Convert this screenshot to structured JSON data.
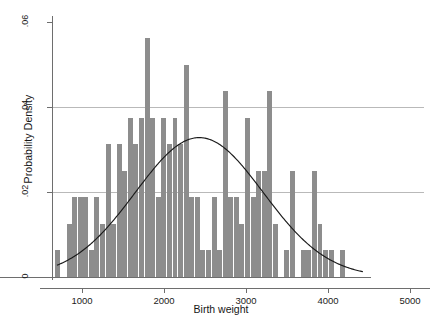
{
  "figure": {
    "xlabel": "Birth weight",
    "ylabel": "Probability Density",
    "caption": ""
  },
  "axes": {
    "y_ticks": [
      "0",
      ".02",
      ".04",
      ".06"
    ],
    "x_ticks": [
      "1000",
      "2000",
      "3000",
      "4000",
      "5000"
    ]
  },
  "colors": {
    "bar_fill": "#8d8d8d",
    "curve": "#1a1a1a",
    "grid": "#b9b9b9",
    "axis": "#6e6e6e",
    "background": "#ffffff"
  },
  "chart_data": {
    "type": "bar",
    "title": "",
    "xlabel": "Birth weight",
    "ylabel": "Probability Density",
    "xlim": [
      500,
      5000
    ],
    "ylim": [
      0,
      0.06
    ],
    "grid": "horizontal gridlines at .02 and .04",
    "legend": "none",
    "bin_width": 68,
    "bar_color": "#8d8d8d",
    "overlay": {
      "type": "line",
      "name": "normal density fit",
      "mean": 2430,
      "sd": 780,
      "peak_value": 0.0328,
      "x_start": 700,
      "x_end": 4420
    },
    "x": [
      710,
      778,
      846,
      914,
      982,
      1050,
      1118,
      1186,
      1254,
      1322,
      1390,
      1458,
      1526,
      1594,
      1662,
      1730,
      1798,
      1866,
      1934,
      2002,
      2070,
      2138,
      2206,
      2274,
      2342,
      2410,
      2478,
      2546,
      2614,
      2682,
      2750,
      2818,
      2886,
      2954,
      3022,
      3090,
      3158,
      3226,
      3294,
      3362,
      3430,
      3498,
      3566,
      3634,
      3702,
      3770,
      3838,
      3906,
      3974,
      4042,
      4110,
      4178,
      4246,
      4314,
      4382
    ],
    "values": [
      0.0063,
      0.0,
      0.0125,
      0.0188,
      0.0188,
      0.0188,
      0.0063,
      0.0188,
      0.0125,
      0.0313,
      0.0125,
      0.0313,
      0.025,
      0.0375,
      0.0313,
      0.0375,
      0.0563,
      0.0375,
      0.0188,
      0.0375,
      0.0313,
      0.0375,
      0.0313,
      0.05,
      0.0188,
      0.0188,
      0.0063,
      0.0063,
      0.0188,
      0.0063,
      0.0438,
      0.0188,
      0.0188,
      0.0125,
      0.0375,
      0.0188,
      0.025,
      0.025,
      0.0438,
      0.0125,
      0.0,
      0.0063,
      0.025,
      0.0,
      0.0063,
      0.0063,
      0.025,
      0.0125,
      0.0063,
      0.0063,
      0.0,
      0.0063,
      0.0,
      0.0,
      0.0
    ]
  }
}
